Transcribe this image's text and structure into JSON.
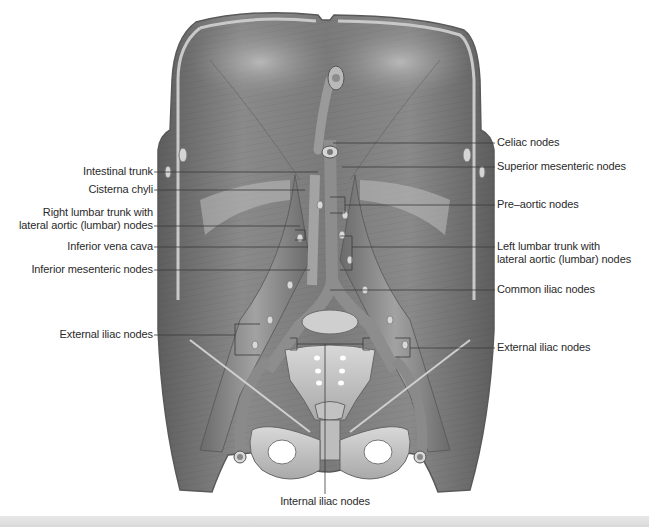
{
  "figure": {
    "palette": {
      "background": "#ffffff",
      "muscle_dark": "#6f6f6f",
      "muscle_mid": "#8c8c8c",
      "muscle_light": "#b5b5b5",
      "bone": "#c9c9c9",
      "bone_light": "#dedede",
      "leader_line": "#3a3a3a",
      "label_text": "#2a2a2a"
    }
  },
  "labels": {
    "left": [
      {
        "id": "intestinal-trunk",
        "text": "Intestinal trunk"
      },
      {
        "id": "cisterna-chyli",
        "text": "Cisterna chyli"
      },
      {
        "id": "right-lumbar-trunk",
        "line1": "Right lumbar trunk with",
        "line2": "lateral aortic (lumbar) nodes"
      },
      {
        "id": "inferior-vena-cava",
        "text": "Inferior vena cava"
      },
      {
        "id": "inferior-mesenteric-nodes",
        "text": "Inferior mesenteric nodes"
      },
      {
        "id": "external-iliac-nodes-left",
        "text": "External iliac nodes"
      }
    ],
    "right": [
      {
        "id": "celiac-nodes",
        "text": "Celiac nodes"
      },
      {
        "id": "superior-mesenteric-nodes",
        "text": "Superior mesenteric nodes"
      },
      {
        "id": "pre-aortic-nodes",
        "text": "Pre–aortic nodes"
      },
      {
        "id": "left-lumbar-trunk",
        "line1": "Left lumbar trunk with",
        "line2": "lateral aortic (lumbar) nodes"
      },
      {
        "id": "common-iliac-nodes",
        "text": "Common iliac nodes"
      },
      {
        "id": "external-iliac-nodes-right",
        "text": "External iliac nodes"
      }
    ],
    "bottom": [
      {
        "id": "internal-iliac-nodes",
        "text": "Internal iliac nodes"
      }
    ]
  }
}
